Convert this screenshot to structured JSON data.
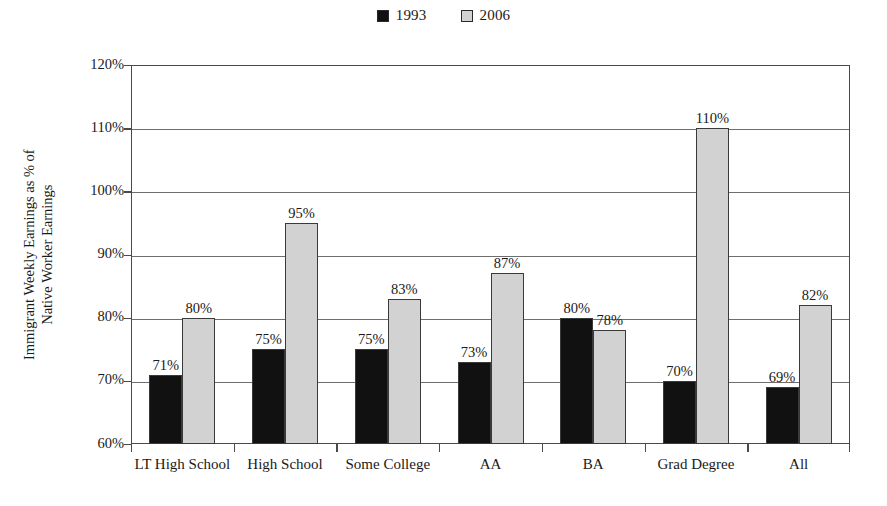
{
  "chart_data": {
    "type": "bar",
    "title": "",
    "subtitle": "",
    "xlabel": "",
    "ylabel": "Immigrant Weekly Earnings as % of Native Worker Earnings",
    "ylabel_lines": [
      "Immigrant Weekly Earnings as % of",
      "Native Worker Earnings"
    ],
    "categories": [
      "LT High School",
      "High School",
      "Some College",
      "AA",
      "BA",
      "Grad Degree",
      "All"
    ],
    "series": [
      {
        "name": "1993",
        "color": "#111111",
        "values": [
          71,
          75,
          75,
          73,
          80,
          70,
          69
        ],
        "labels": [
          "71%",
          "75%",
          "75%",
          "73%",
          "80%",
          "70%",
          "69%"
        ]
      },
      {
        "name": "2006",
        "color": "#d2d2d2",
        "values": [
          80,
          95,
          83,
          87,
          78,
          110,
          82
        ],
        "labels": [
          "80%",
          "95%",
          "83%",
          "87%",
          "78%",
          "110%",
          "82%"
        ]
      }
    ],
    "ylim": [
      60,
      120
    ],
    "ytick_values": [
      60,
      70,
      80,
      90,
      100,
      110,
      120
    ],
    "ytick_labels": [
      "60%",
      "70%",
      "80%",
      "90%",
      "100%",
      "110%",
      "120%"
    ],
    "grid": true,
    "grid_axis": "y",
    "legend": {
      "position": "top-center",
      "entries": [
        "1993",
        "2006"
      ]
    },
    "value_labels": true,
    "unit": "%"
  },
  "colors": {
    "series_1993": "#111111",
    "series_2006": "#d2d2d2",
    "axis": "#4a4a4a",
    "gridline": "#6e6e6e",
    "text": "#1a1a1a",
    "background": "#ffffff"
  }
}
